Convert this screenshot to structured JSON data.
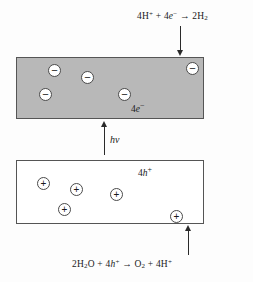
{
  "diagram": {
    "equations": {
      "top": {
        "text": "4H+ + 4e- → 2H2",
        "reactant_proton_count": "4",
        "reactant_electron_count": "4",
        "product_hydrogen_count": "2"
      },
      "bottom": {
        "text": "2H2O + 4h+ → O2 + 4H+",
        "reactant_water_count": "2",
        "reactant_hole_count": "4",
        "product_oxygen_count": "1",
        "product_proton_count": "4"
      }
    },
    "conduction_band": {
      "label": "4e-",
      "label_coefficient": "4",
      "label_species": "e",
      "label_charge": "−",
      "fill_color": "#b8b8b8",
      "border_color": "#555555",
      "carrier_sign": "−",
      "carrier_count": 5,
      "carriers": [
        {
          "name": "electron-1",
          "x": 47,
          "y": 70
        },
        {
          "name": "electron-2",
          "x": 80,
          "y": 77
        },
        {
          "name": "electron-3",
          "x": 185,
          "y": 68
        },
        {
          "name": "electron-4",
          "x": 38,
          "y": 94
        },
        {
          "name": "electron-5",
          "x": 117,
          "y": 94
        }
      ]
    },
    "valence_band": {
      "label": "4h+",
      "label_coefficient": "4",
      "label_species": "h",
      "label_charge": "+",
      "fill_color": "#ffffff",
      "border_color": "#555555",
      "carrier_sign": "+",
      "carrier_count": 5,
      "carriers": [
        {
          "name": "hole-1",
          "x": 36,
          "y": 176
        },
        {
          "name": "hole-2",
          "x": 69,
          "y": 182
        },
        {
          "name": "hole-3",
          "x": 109,
          "y": 187
        },
        {
          "name": "hole-4",
          "x": 57,
          "y": 202
        },
        {
          "name": "hole-5",
          "x": 169,
          "y": 209
        }
      ]
    },
    "excitation": {
      "label": "hv",
      "description": "photon absorption arrow"
    },
    "arrows": {
      "top_label": "reduction-arrow",
      "middle_label": "photoexcitation-arrow",
      "bottom_label": "oxidation-arrow"
    },
    "colors": {
      "gray_band": "#b8b8b8",
      "stroke": "#2a2a2a",
      "box_border": "#555555",
      "background": "#fdfdfd"
    }
  }
}
